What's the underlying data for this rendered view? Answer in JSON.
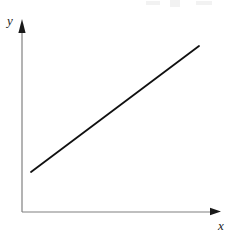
{
  "figure": {
    "title": "",
    "background_color": "#ffffff",
    "width": 236,
    "height": 234,
    "y_axis_label": "y",
    "x_axis_label": "x",
    "axis_color": "#808080",
    "arrowhead_color": "#1a1a1a",
    "line_color": "#111111"
  },
  "chart_data": {
    "type": "line",
    "title": "",
    "xlabel": "x",
    "ylabel": "y",
    "grid": false,
    "legend": null,
    "axis_style": "arrow-ended first-quadrant axes, no tick marks, no tick labels",
    "origin_px": [
      22,
      212
    ],
    "x_axis_end_px": [
      220,
      212
    ],
    "y_axis_end_px": [
      22,
      19
    ],
    "series": [
      {
        "name": "line",
        "description": "straight line with positive slope, not passing through origin",
        "x": [
          0.05,
          1.0
        ],
        "y": [
          0.21,
          0.86
        ],
        "points_px": [
          [
            31,
            172
          ],
          [
            199,
            46
          ]
        ],
        "slope_px": -0.75,
        "line_width_px": 1.8
      }
    ],
    "xlim": [
      0,
      1
    ],
    "ylim": [
      0,
      1
    ],
    "xticks": [],
    "yticks": [],
    "annotations": []
  },
  "artifacts": {
    "top_edge_smudges": 3,
    "note": "faint light-gray scan speckles along top edge"
  }
}
